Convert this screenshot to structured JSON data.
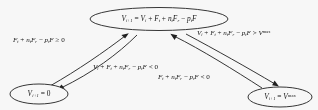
{
  "diagram": {
    "type": "state-transition-diagram",
    "background_color": "#ffffff",
    "stroke_color": "#1a1a1a",
    "nodes": [
      {
        "id": "top",
        "name": "state-node-update",
        "label_plain": "V(i+1) = V(i) + F(t) + n(t)F(r) - p(t)F",
        "parts": {
          "lhs_var": "V",
          "lhs_sub": "i+1",
          "eq": "=",
          "t1_var": "V",
          "t1_sub": "i",
          "plus1": "+",
          "t2_var": "F",
          "t2_sub": "t",
          "plus2": "+",
          "t3_coef": "n",
          "t3_coef_sub": "t",
          "t3_var": "F",
          "t3_sub": "r",
          "minus1": "−",
          "t4_coef": "p",
          "t4_coef_sub": "t",
          "t4_var": "F"
        }
      },
      {
        "id": "bottom-left",
        "name": "state-node-zero",
        "label_plain": "V(i+1) = 0",
        "parts": {
          "lhs_var": "V",
          "lhs_sub": "i+1",
          "eq": "=",
          "value": "0"
        }
      },
      {
        "id": "bottom-right",
        "name": "state-node-max",
        "label_plain": "V(i+1) = V^max",
        "parts": {
          "lhs_var": "V",
          "lhs_sub": "i+1",
          "eq": "=",
          "rhs_var": "V",
          "rhs_sup": "max"
        }
      }
    ],
    "edge_labels": [
      {
        "id": "left-up",
        "name": "edge-label-reset-to-update",
        "plain": "F(t) + n(t)F(r) - p(t)F ≥ 0",
        "parts": {
          "t1_var": "F",
          "t1_sub": "t",
          "plus1": "+",
          "t2_coef": "n",
          "t2_coef_sub": "t",
          "t2_var": "F",
          "t2_sub": "r",
          "minus1": "−",
          "t3_coef": "p",
          "t3_coef_sub": "t",
          "t3_var": "F",
          "rel": "≥",
          "value": "0"
        }
      },
      {
        "id": "right-up",
        "name": "edge-label-update-to-max",
        "plain": "V(i) + F(t) + n(t)F(r) - p(t)F > V^max",
        "parts": {
          "t0_var": "V",
          "t0_sub": "i",
          "plus0": "+",
          "t1_var": "F",
          "t1_sub": "t",
          "plus1": "+",
          "t2_coef": "n",
          "t2_coef_sub": "t",
          "t2_var": "F",
          "t2_sub": "r",
          "minus1": "−",
          "t3_coef": "p",
          "t3_coef_sub": "t",
          "t3_var": "F",
          "rel": ">",
          "rhs_var": "V",
          "rhs_sup": "max"
        }
      },
      {
        "id": "center-down",
        "name": "edge-label-update-to-zero",
        "plain": "V(i) + F(t) + n(t)F(r) - p(t)F < 0",
        "parts": {
          "t0_var": "V",
          "t0_sub": "i",
          "plus0": "+",
          "t1_var": "F",
          "t1_sub": "t",
          "plus1": "+",
          "t2_coef": "n",
          "t2_coef_sub": "t",
          "t2_var": "F",
          "t2_sub": "r",
          "minus1": "−",
          "t3_coef": "p",
          "t3_coef_sub": "t",
          "t3_var": "F",
          "rel": "<",
          "value": "0"
        }
      },
      {
        "id": "lower-right",
        "name": "edge-label-max-to-update",
        "plain": "F(t) + n(t)F(r) - p(t)F < 0",
        "parts": {
          "t1_var": "F",
          "t1_sub": "t",
          "plus1": "+",
          "t2_coef": "n",
          "t2_coef_sub": "t",
          "t2_var": "F",
          "t2_sub": "r",
          "minus1": "−",
          "t3_coef": "p",
          "t3_coef_sub": "t",
          "t3_var": "F",
          "rel": "<",
          "value": "0"
        }
      }
    ]
  }
}
